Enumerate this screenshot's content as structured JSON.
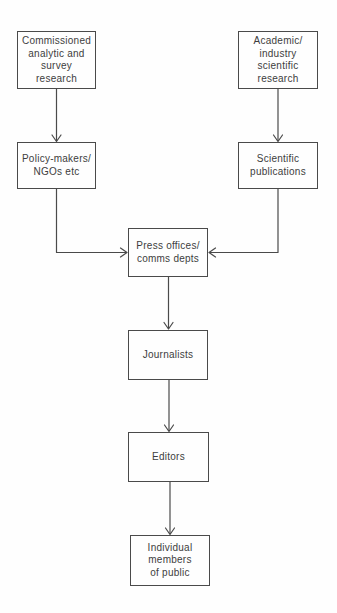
{
  "diagram": {
    "type": "flowchart",
    "direction": "top-down",
    "nodes": {
      "commissioned": {
        "label": "Commissioned\nanalytic and\nsurvey\nresearch"
      },
      "academic": {
        "label": "Academic/\nindustry\nscientific\nresearch"
      },
      "policy": {
        "label": "Policy-makers/\nNGOs etc"
      },
      "scientific": {
        "label": "Scientific\npublications"
      },
      "press": {
        "label": "Press offices/\ncomms depts"
      },
      "journalists": {
        "label": "Journalists"
      },
      "editors": {
        "label": "Editors"
      },
      "public": {
        "label": "Individual\nmembers\nof public"
      }
    },
    "edges": [
      {
        "from": "commissioned",
        "to": "policy"
      },
      {
        "from": "academic",
        "to": "scientific"
      },
      {
        "from": "policy",
        "to": "press"
      },
      {
        "from": "scientific",
        "to": "press"
      },
      {
        "from": "press",
        "to": "journalists"
      },
      {
        "from": "journalists",
        "to": "editors"
      },
      {
        "from": "editors",
        "to": "public"
      }
    ],
    "colors": {
      "line": "#4a4a4a",
      "text": "#3d3d3d",
      "box_background": "#fefefe"
    }
  }
}
